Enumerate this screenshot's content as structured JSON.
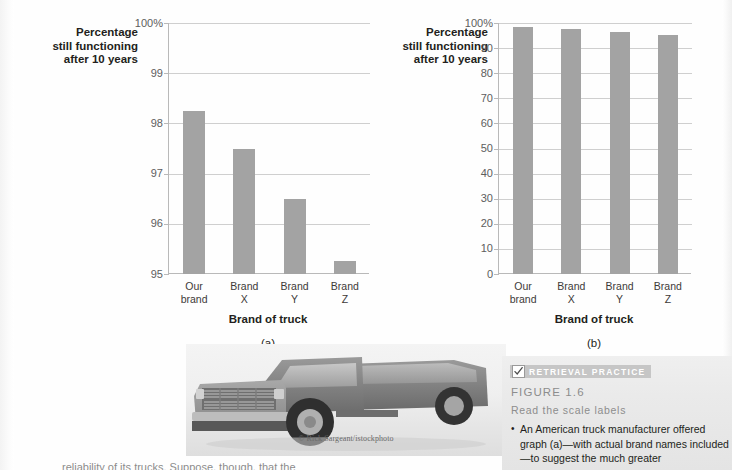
{
  "chart_data": [
    {
      "type": "bar",
      "panel": "(a)",
      "title": "",
      "ylabel": "Percentage still functioning after 10 years",
      "ylabel_lines": [
        "Percentage",
        "still functioning",
        "after 10 years"
      ],
      "xlabel": "Brand of truck",
      "categories": [
        "Our brand",
        "Brand X",
        "Brand Y",
        "Brand Z"
      ],
      "category_lines": [
        [
          "Our",
          "brand"
        ],
        [
          "Brand",
          "X"
        ],
        [
          "Brand",
          "Y"
        ],
        [
          "Brand",
          "Z"
        ]
      ],
      "values": [
        98.25,
        97.5,
        96.5,
        95.25
      ],
      "ylim": [
        95,
        100
      ],
      "yticks": [
        100,
        99,
        98,
        97,
        96,
        95
      ],
      "ytick_labels": [
        "100%",
        "99",
        "98",
        "97",
        "96",
        "95"
      ],
      "grid": true,
      "legend": "none",
      "bar_color": "#a3a3a3"
    },
    {
      "type": "bar",
      "panel": "(b)",
      "title": "",
      "ylabel": "Percentage still functioning after 10 years",
      "ylabel_lines": [
        "Percentage",
        "still functioning",
        "after 10 years"
      ],
      "xlabel": "Brand of truck",
      "categories": [
        "Our brand",
        "Brand X",
        "Brand Y",
        "Brand Z"
      ],
      "category_lines": [
        [
          "Our",
          "brand"
        ],
        [
          "Brand",
          "X"
        ],
        [
          "Brand",
          "Y"
        ],
        [
          "Brand",
          "Z"
        ]
      ],
      "values": [
        98.25,
        97.5,
        96.5,
        95.25
      ],
      "ylim": [
        0,
        100
      ],
      "yticks": [
        100,
        90,
        80,
        70,
        60,
        50,
        40,
        30,
        20,
        10,
        0
      ],
      "ytick_labels": [
        "100%",
        "90",
        "80",
        "70",
        "60",
        "50",
        "40",
        "30",
        "20",
        "10",
        "0"
      ],
      "grid": true,
      "legend": "none",
      "bar_color": "#a3a3a3"
    }
  ],
  "chart_a": {
    "ylabel_1": "Percentage",
    "ylabel_2": "still functioning",
    "ylabel_3": "after 10 years",
    "xaxis_title": "Brand of truck",
    "panel_letter": "(a)"
  },
  "chart_b": {
    "ylabel_1": "Percentage",
    "ylabel_2": "still functioning",
    "ylabel_3": "after 10 years",
    "xaxis_title": "Brand of truck",
    "panel_letter": "(b)"
  },
  "photo": {
    "alt": "gray pickup truck",
    "credit": "© Rick Sargeant/istockphoto"
  },
  "retrieval_practice": {
    "badge_label": "RETRIEVAL PRACTICE",
    "badge_icon": "checkmark-icon",
    "figure_number": "FIGURE 1.6",
    "subtitle": "Read the scale labels",
    "bullet_marker": "•",
    "bullet_text": "An American truck manufacturer offered graph (a)—with actual brand names included—to suggest the much greater"
  },
  "bottom_text": {
    "cropped_line": "reliability of its trucks. Suppose, though, that the"
  },
  "colors": {
    "bar": "#a3a3a3",
    "gridline": "#cfcfcf",
    "axis": "#b9b9b9",
    "text": "#231f20",
    "muted_text": "#8d8d8d",
    "panel_bg": "#eaeaea",
    "badge_bg": "#c6c6c6"
  }
}
